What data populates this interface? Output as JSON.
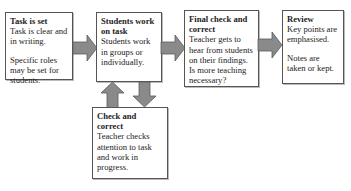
{
  "diagram": {
    "colors": {
      "arrow_fill": "#8a8a8a",
      "arrow_stroke": "#5a5a5a",
      "box_border": "#555555"
    },
    "boxes": [
      {
        "id": "task-is-set",
        "title": "Task is set",
        "paragraphs": [
          "Task is clear and in writing.",
          "Specific roles may be set for students."
        ]
      },
      {
        "id": "students-work",
        "title": "Students work on task",
        "paragraphs": [
          "Students work in groups or individually."
        ]
      },
      {
        "id": "final-check",
        "title": "Final check and correct",
        "paragraphs": [
          "Teacher gets to hear from students on their findings. Is more teaching necessary?"
        ]
      },
      {
        "id": "review",
        "title": "Review",
        "paragraphs": [
          "Key points are emphasised.",
          "Notes are taken or kept."
        ]
      },
      {
        "id": "check-correct",
        "title": "Check and correct",
        "paragraphs": [
          "Teacher checks attention to task and work in progress."
        ]
      }
    ],
    "arrows": [
      {
        "from": "task-is-set",
        "to": "students-work",
        "direction": "right"
      },
      {
        "from": "students-work",
        "to": "final-check",
        "direction": "right"
      },
      {
        "from": "final-check",
        "to": "review",
        "direction": "right"
      },
      {
        "from": "check-correct",
        "to": "students-work",
        "direction": "up"
      },
      {
        "from": "students-work",
        "to": "check-correct",
        "direction": "down"
      }
    ]
  }
}
